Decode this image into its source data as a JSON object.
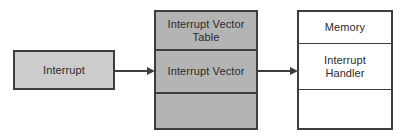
{
  "diagram": {
    "colors": {
      "source_fill": "#cccccc",
      "table_fill": "#b4b4b4",
      "memory_fill": "#ffffff",
      "stroke": "#3d3d3d",
      "text": "#2b2b2b",
      "background": "#ffffff"
    },
    "source": {
      "label": "Interrupt"
    },
    "vector_table": {
      "cells": [
        {
          "label": "Interrupt Vector\nTable"
        },
        {
          "label": "Interrupt Vector"
        },
        {
          "label": ""
        }
      ]
    },
    "memory": {
      "cells": [
        {
          "label": "Memory"
        },
        {
          "label": "Interrupt\nHandler"
        },
        {
          "label": ""
        }
      ]
    },
    "connectors": [
      {
        "name": "interrupt-to-vector-table",
        "label": ""
      },
      {
        "name": "vector-to-handler",
        "label": ""
      }
    ]
  }
}
